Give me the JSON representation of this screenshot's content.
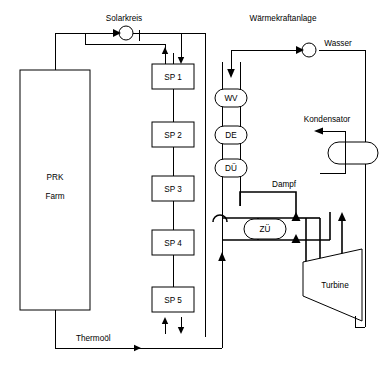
{
  "diagram": {
    "labels": {
      "solar_loop": "Solarkreis",
      "power_plant": "Wärmekraftanlage",
      "water": "Wasser",
      "condenser": "Kondensator",
      "steam": "Dampf",
      "thermal_oil": "Thermoöl",
      "turbine": "Turbine"
    },
    "collector_field": {
      "name": "PRK Farm",
      "line1": "PRK",
      "line2": "Farm"
    },
    "storage_units": [
      {
        "id": "sp1",
        "label": "SP 1"
      },
      {
        "id": "sp2",
        "label": "SP 2"
      },
      {
        "id": "sp3",
        "label": "SP 3"
      },
      {
        "id": "sp4",
        "label": "SP 4"
      },
      {
        "id": "sp5",
        "label": "SP 5"
      }
    ],
    "heat_exchangers": [
      {
        "id": "wv",
        "label": "WV"
      },
      {
        "id": "de",
        "label": "DE"
      },
      {
        "id": "du",
        "label": "DÜ"
      },
      {
        "id": "zu",
        "label": "ZÜ"
      }
    ],
    "colors": {
      "line": "#000000",
      "background": "#ffffff",
      "text": "#000000"
    }
  }
}
